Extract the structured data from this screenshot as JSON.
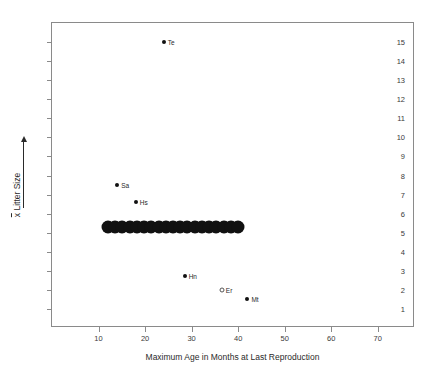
{
  "chart_data": {
    "type": "scatter",
    "title": "",
    "xlabel": "Maximum Age in Months at Last Reproduction",
    "ylabel": "Litter Size",
    "ylabel_prefix": "x",
    "xlim": [
      0,
      78
    ],
    "ylim": [
      0,
      16
    ],
    "xticks": [
      10,
      20,
      30,
      40,
      50,
      60,
      70
    ],
    "yticks": [
      1,
      2,
      3,
      4,
      5,
      6,
      7,
      8,
      9,
      10,
      11,
      12,
      13,
      14,
      15
    ],
    "grid": false,
    "legend": "none",
    "points": [
      {
        "label": "Te",
        "x": 24.0,
        "y": 15.0,
        "marker": "filled"
      },
      {
        "label": "Sa",
        "x": 14.0,
        "y": 7.5,
        "marker": "filled"
      },
      {
        "label": "Hs",
        "x": 18.0,
        "y": 6.6,
        "marker": "filled"
      },
      {
        "label": "Hn",
        "x": 28.5,
        "y": 2.75,
        "marker": "filled"
      },
      {
        "label": "Er",
        "x": 36.5,
        "y": 2.0,
        "marker": "open"
      },
      {
        "label": "Mt",
        "x": 42.0,
        "y": 1.5,
        "marker": "filled"
      }
    ],
    "cluster": {
      "note": "dense band of overlapping filled circles",
      "y": 5.3,
      "x_start": 12.0,
      "x_end": 40.0,
      "count": 19,
      "marker": "filled"
    }
  },
  "axis": {
    "x_title": "Maximum Age in Months at Last Reproduction",
    "y_title": "Litter Size"
  }
}
